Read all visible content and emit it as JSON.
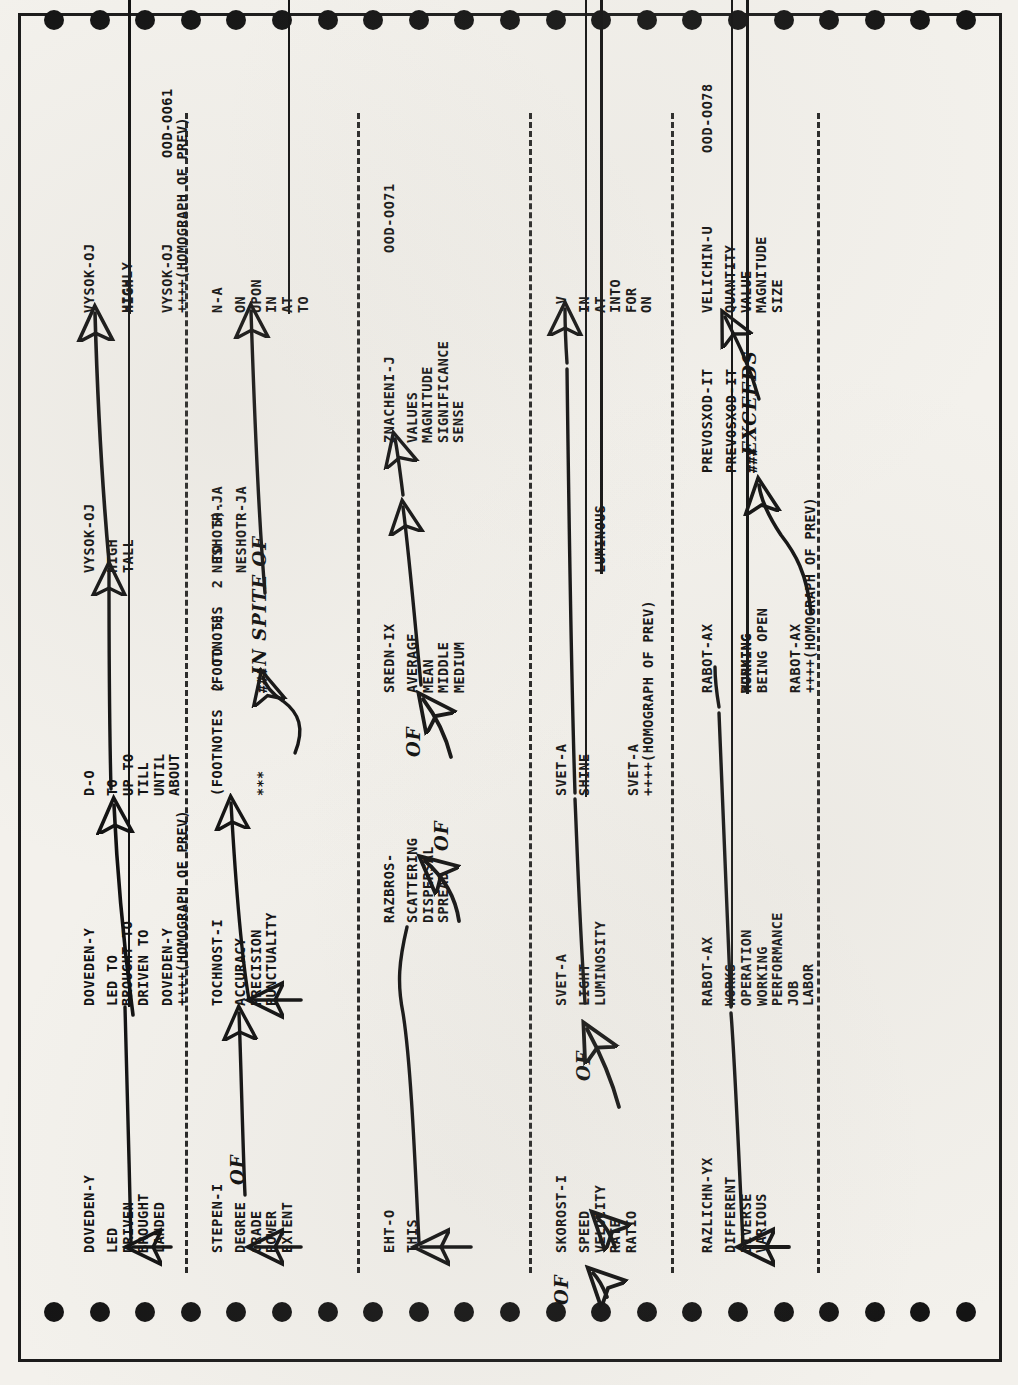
{
  "document": {
    "kind": "scanned-dictionary-printout",
    "orientation": "rotated-90-ccw",
    "page_codes": [
      "OOD-OO61",
      "OOD-OO71",
      "OOD-OO78"
    ]
  },
  "rows": [
    {
      "id": "row-1",
      "entries": [
        {
          "headword": "DOVEDEN-Y",
          "senses": [
            "LED",
            "DRIVEN",
            "BROUGHT",
            "LANDED"
          ]
        },
        {
          "headword": "DOVEDEN-Y",
          "senses": [
            "LED TO",
            "BROUGHT TO",
            "DRIVEN TO"
          ],
          "struck": "BROUGHT TO"
        },
        {
          "headword": "DOVEDEN-Y",
          "plus": "++++(HOMOGRAPH OF PREV)"
        },
        {
          "headword": "D-O",
          "senses": [
            "TO",
            "UP TO",
            "TILL",
            "UNTIL",
            "ABOUT"
          ]
        },
        {
          "headword": "VYSOK-OJ",
          "senses": [
            "HIGH",
            "TALL"
          ]
        },
        {
          "headword": "VYSOK-OJ",
          "senses": [
            "HIGH",
            "HIGHLY"
          ],
          "struck": "HIGH"
        },
        {
          "headword": "VYSOK-OJ",
          "plus": "++++(HOMOGRAPH OF PREV)",
          "code": "OOD-OO61"
        }
      ]
    },
    {
      "id": "row-2",
      "entries": [
        {
          "headword": "STEPEN-I",
          "senses": [
            "DEGREE",
            "GRADE",
            "POWER",
            "EXTENT"
          ],
          "hand": "OF"
        },
        {
          "headword": "TOCHNOST-I",
          "senses": [
            "ACCURACY",
            "PRECISION",
            "PUNCTUALITY"
          ]
        },
        {
          "headword": "(FOOTNOTES 2 TO 5).",
          "marker": "***"
        },
        {
          "headword": "(FOOTNOTES 2 TO 5).",
          "marker": "###",
          "hand": "IN SPITE OF"
        },
        {
          "headword": "NESHOTR-JA"
        },
        {
          "headword": "NESHOTR-JA"
        },
        {
          "headword": "N-A",
          "senses": [
            "ON",
            "UPON",
            "IN",
            "AT",
            "TO"
          ],
          "struck": "AT"
        }
      ]
    },
    {
      "id": "row-3",
      "entries": [
        {
          "headword": "EHT-O",
          "senses": [
            "THIS"
          ]
        },
        {
          "headword": "RAZBROS-",
          "senses": [
            "SCATTERING",
            "DISPERSAL",
            "SPREAD"
          ],
          "hand": "OF"
        },
        {
          "headword": "SREDN-IX",
          "senses": [
            "AVERAGE",
            "MEAN",
            "MIDDLE",
            "MEDIUM"
          ],
          "hand": "OF"
        },
        {
          "headword": "ZNACHENI-J",
          "senses": [
            "VALUES",
            "MAGNITUDE",
            "SIGNIFICANCE",
            "SENSE"
          ],
          "code": "OOD-OO71"
        }
      ]
    },
    {
      "id": "row-4",
      "entries": [
        {
          "headword": "SKOROST-I",
          "senses": [
            "SPEED",
            "VELOCITY",
            "RATE",
            "RATIO"
          ],
          "hand": "OF",
          "hand2": "OF"
        },
        {
          "headword": "SVET-A",
          "senses": [
            "LIGHT",
            "LUMINOSITY"
          ]
        },
        {
          "headword": "SVET-A",
          "senses": [
            "SHINE",
            "LUMINOUS"
          ],
          "struck": "SHINE"
        },
        {
          "headword": "SVET-A",
          "plus": "++++(HOMOGRAPH OF PREV)"
        },
        {
          "headword": "-V",
          "senses": [
            "IN",
            "AT",
            "INTO",
            "FOR",
            "ON"
          ]
        }
      ]
    },
    {
      "id": "row-5",
      "entries": [
        {
          "headword": "RAZLICHN-YX",
          "senses": [
            "DIFFERENT",
            "DIVERSE",
            "VARIOUS"
          ]
        },
        {
          "headword": "RABOT-AX",
          "senses": [
            "WORKS",
            "OPERATION",
            "WORKING",
            "PERFORMANCE",
            "JOB",
            "LABOR"
          ],
          "struck": "WORKS"
        },
        {
          "headword": "RABOT-AX",
          "senses": [
            "WORKING",
            "RUNNING",
            "BEING OPEN"
          ],
          "struck": "WORKING"
        },
        {
          "headword": "RABOT-AX",
          "plus": "++++(HOMOGRAPH OF PREV)"
        },
        {
          "headword": "PREVOSXOD-IT"
        },
        {
          "headword": "PREVOSXOD-IT",
          "marker": "###",
          "hand": "EXCEEDS"
        },
        {
          "headword": "VELICHIN-U",
          "senses": [
            "QUANTITY",
            "VALUE",
            "MAGNITUDE",
            "SIZE"
          ],
          "code": "OOD-OO78"
        }
      ]
    }
  ],
  "labels": {
    "row1": {
      "h1": "DOVEDEN-Y",
      "s1": "LED\nDRIVEN\nBROUGHT\nLANDED",
      "h2": "DOVEDEN-Y",
      "s2a": "LED TO",
      "s2b": "BROUGHT TO",
      "s2c": "DRIVEN TO",
      "h3": "DOVEDEN-Y",
      "p3": "++++(HOMOGRAPH OF PREV)",
      "h4": "D-O",
      "s4": "TO\nUP TO\nTILL\nUNTIL\nABOUT",
      "h5": "VYSOK-OJ",
      "s5": "HIGH\nTALL",
      "h6": "VYSOK-OJ",
      "s6a": "HIGH",
      "s6b": "HIGHLY",
      "h7": "VYSOK-OJ",
      "p7": "++++(HOMOGRAPH OF PREV)",
      "c7": "OOD-OO61"
    },
    "row2": {
      "h1": "STEPEN-I",
      "s1": "DEGREE\nGRADE\nPOWER\nEXTENT",
      "hand1": "OF",
      "h2": "TOCHNOST-I",
      "s2": "ACCURACY\nPRECISION\nPUNCTUALITY",
      "f1": "(FOOTNOTES  2  TO  5).",
      "m1": "***",
      "f2": "(FOOTNOTES  2  TO  5).",
      "m2": "###",
      "hand2": "IN SPITE OF",
      "h3": "NESHOTR-JA",
      "h4": "NESHOTR-JA",
      "h5": "N-A",
      "s5a": "ON\nUPON\nIN",
      "s5b": "AT",
      "s5c": "TO"
    },
    "row3": {
      "h1": "EHT-O",
      "s1": "THIS",
      "h2": "RAZBROS-",
      "s2": "SCATTERING\nDISPERSAL\nSPREAD",
      "hand2": "OF",
      "h3": "SREDN-IX",
      "s3": "AVERAGE\nMEAN\nMIDDLE\nMEDIUM",
      "hand3": "OF",
      "h4": "ZNACHENI-J",
      "s4a": "VALUES",
      "s4b": "MAGNITUDE\nSIGNIFICANCE\nSENSE",
      "c4": "OOD-OO71"
    },
    "row4": {
      "h1": "SKOROST-I",
      "s1": "SPEED\nVELOCITY\nRATE\nRATIO",
      "hand1": "OF",
      "hand0": "OF",
      "h2": "SVET-A",
      "s2": "LIGHT\nLUMINOSITY",
      "hand2": "OF",
      "h3": "SVET-A",
      "s3a": "SHINE",
      "s3b": "LUMINOUS",
      "h4": "SVET-A",
      "p4": "++++(HOMOGRAPH OF PREV)",
      "h5": "-V",
      "s5": "IN\nAT\nINTO\nFOR\nON"
    },
    "row5": {
      "h1": "RAZLICHN-YX",
      "s1": "DIFFERENT\nDIVERSE\nVARIOUS",
      "h2": "RABOT-AX",
      "s2a": "WORKS",
      "s2b": "OPERATION\nWORKING\nPERFORMANCE\nJOB\nLABOR",
      "h3": "RABOT-AX",
      "s3a": "WORKING",
      "s3b": "RUNNING\nBEING OPEN",
      "h4": "RABOT-AX",
      "p4": "++++(HOMOGRAPH OF PREV)",
      "h5": "PREVOSXOD-IT",
      "h6": "PREVOSXOD-IT",
      "m6": "###",
      "hand6": "EXCEEDS",
      "h7": "VELICHIN-U",
      "s7": "QUANTITY\nVALUE\nMAGNITUDE\nSIZE",
      "c7": "OOD-OO78"
    }
  }
}
